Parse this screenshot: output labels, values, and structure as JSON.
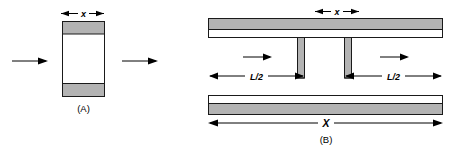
{
  "figure": {
    "type": "technical-diagram",
    "background_color": "#ffffff",
    "fill_color": "#b3b3b3",
    "line_color": "#000000",
    "panels": [
      {
        "id": "A",
        "caption": "(A)",
        "dimension_labels": [
          {
            "name": "width-x",
            "text": "x",
            "style": "bold-italic",
            "position": "above-block"
          }
        ],
        "flow_arrows": [
          {
            "name": "inlet-arrow",
            "direction": "right",
            "side": "left"
          },
          {
            "name": "outlet-arrow",
            "direction": "right",
            "side": "right"
          }
        ],
        "shape": "single vertical slab with shaded top and bottom bands"
      },
      {
        "id": "B",
        "caption": "(B)",
        "dimension_labels": [
          {
            "name": "gap-width-x",
            "text": "x",
            "style": "bold-italic",
            "position": "above-top-bar"
          },
          {
            "name": "left-half-length",
            "text": "L/2",
            "style": "bold-italic",
            "position": "left-channel"
          },
          {
            "name": "right-half-length",
            "text": "L/2",
            "style": "bold-italic",
            "position": "right-channel"
          },
          {
            "name": "total-width-X",
            "text": "X",
            "style": "bold-italic",
            "position": "below-bottom-bar"
          }
        ],
        "flow_arrows": [
          {
            "name": "left-flow-arrow",
            "direction": "right",
            "side": "left-channel"
          },
          {
            "name": "right-flow-arrow",
            "direction": "right",
            "side": "right-channel"
          }
        ],
        "shape": "two horizontal slabs with two opposing vertical walls forming a central gap"
      }
    ]
  }
}
